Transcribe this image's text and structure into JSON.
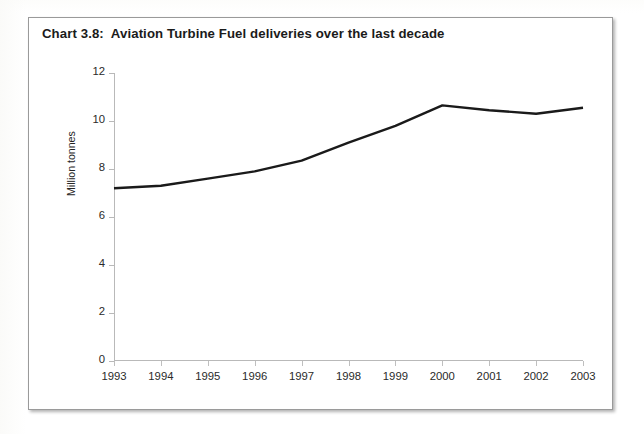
{
  "title": "Chart 3.8:  Aviation Turbine Fuel deliveries over the last decade",
  "axis": {
    "y_title": "Million tonnes",
    "y_ticks": [
      "0",
      "2",
      "4",
      "6",
      "8",
      "10",
      "12"
    ],
    "x_ticks": [
      "1993",
      "1994",
      "1995",
      "1996",
      "1997",
      "1998",
      "1999",
      "2000",
      "2001",
      "2002",
      "2003"
    ]
  },
  "colors": {
    "line": "#1a1a1a",
    "axis": "#b9b9b9",
    "frame": "#9a9a9a",
    "text": "#1b1b1b",
    "background": "#ffffff"
  },
  "chart_data": {
    "type": "line",
    "title": "Chart 3.8:  Aviation Turbine Fuel deliveries over the last decade",
    "xlabel": "",
    "ylabel": "Million tonnes",
    "x": [
      "1993",
      "1994",
      "1995",
      "1996",
      "1997",
      "1998",
      "1999",
      "2000",
      "2001",
      "2002",
      "2003"
    ],
    "values": [
      7.2,
      7.3,
      7.6,
      7.9,
      8.35,
      9.1,
      9.8,
      10.65,
      10.45,
      10.3,
      10.55
    ],
    "series": [
      {
        "name": "Aviation Turbine Fuel deliveries",
        "values": [
          7.2,
          7.3,
          7.6,
          7.9,
          8.35,
          9.1,
          9.8,
          10.65,
          10.45,
          10.3,
          10.55
        ]
      }
    ],
    "ylim": [
      0,
      12
    ],
    "ytick_step": 2,
    "grid": false,
    "legend": false,
    "line_color": "#1a1a1a",
    "line_width": 2.4
  }
}
